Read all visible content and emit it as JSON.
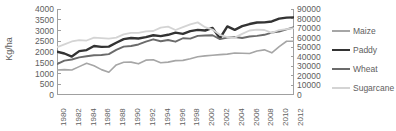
{
  "chart_data": {
    "type": "line",
    "title": "",
    "xlabel": "",
    "ylabel": "Kg/ha",
    "ylabel_right": "",
    "grid": false,
    "legend_position": "right",
    "x": [
      1980,
      1981,
      1982,
      1983,
      1984,
      1985,
      1986,
      1987,
      1988,
      1989,
      1990,
      1991,
      1992,
      1993,
      1994,
      1995,
      1996,
      1997,
      1998,
      1999,
      2000,
      2001,
      2002,
      2003,
      2004,
      2005,
      2006,
      2007,
      2008,
      2009,
      2010,
      2011,
      2012
    ],
    "x_tick_labels": [
      "1980",
      "1982",
      "1984",
      "1986",
      "1988",
      "1990",
      "1992",
      "1994",
      "1996",
      "1998",
      "2000",
      "2002",
      "2004",
      "2006",
      "2008",
      "2010",
      "2012"
    ],
    "ylim": [
      0,
      4000
    ],
    "y_tick_labels": [
      "0",
      "500",
      "1000",
      "1500",
      "2000",
      "2500",
      "3000",
      "3500",
      "4000"
    ],
    "ylim_right": [
      0,
      90000
    ],
    "y_tick_labels_right": [
      "0",
      "10000",
      "20000",
      "30000",
      "40000",
      "50000",
      "60000",
      "70000",
      "80000",
      "90000"
    ],
    "series": [
      {
        "name": "Maize",
        "axis": "left",
        "color": "#A6A6A6",
        "width": 1.6,
        "values": [
          1160,
          1180,
          1160,
          1320,
          1480,
          1360,
          1180,
          1060,
          1400,
          1520,
          1530,
          1450,
          1620,
          1640,
          1500,
          1530,
          1600,
          1610,
          1690,
          1780,
          1820,
          1850,
          1880,
          1900,
          1950,
          1940,
          1930,
          2050,
          2100,
          1960,
          2250,
          2500,
          2500
        ]
      },
      {
        "name": "Paddy",
        "axis": "left",
        "color": "#333333",
        "width": 2.4,
        "values": [
          2010,
          1930,
          1790,
          2040,
          2090,
          2280,
          2240,
          2250,
          2430,
          2600,
          2650,
          2630,
          2690,
          2780,
          2740,
          2800,
          2900,
          2840,
          2970,
          3030,
          3000,
          3120,
          2640,
          3190,
          3030,
          3200,
          3300,
          3370,
          3380,
          3420,
          3550,
          3600,
          3610
        ]
      },
      {
        "name": "Wheat",
        "axis": "left",
        "color": "#6B6B6B",
        "width": 1.9,
        "values": [
          1440,
          1600,
          1650,
          1750,
          1800,
          1850,
          1860,
          1900,
          2100,
          2250,
          2280,
          2350,
          2480,
          2590,
          2500,
          2560,
          2480,
          2640,
          2620,
          2750,
          2770,
          2780,
          2600,
          2670,
          2700,
          2650,
          2720,
          2750,
          2800,
          2900,
          2950,
          3050,
          3150
        ]
      },
      {
        "name": "Sugarcane",
        "axis": "right",
        "color": "#D4D4D4",
        "width": 1.8,
        "values": [
          50000,
          53000,
          56000,
          57500,
          57000,
          60000,
          59500,
          59000,
          60000,
          63500,
          65000,
          65000,
          66500,
          67000,
          70500,
          71500,
          68000,
          71000,
          74000,
          76000,
          71000,
          68500,
          63000,
          60500,
          60000,
          64000,
          67500,
          68500,
          68000,
          65000,
          68000,
          69000,
          70000
        ]
      }
    ]
  },
  "legend": {
    "items": [
      {
        "label": "Maize",
        "color": "#A6A6A6",
        "width": 1.6
      },
      {
        "label": "Paddy",
        "color": "#333333",
        "width": 2.6
      },
      {
        "label": "Wheat",
        "color": "#6B6B6B",
        "width": 2.0
      },
      {
        "label": "Sugarcane",
        "color": "#D4D4D4",
        "width": 1.8
      }
    ]
  },
  "axis_colors": {
    "axis_line": "#A0A0A0",
    "tick_text": "#606060"
  }
}
